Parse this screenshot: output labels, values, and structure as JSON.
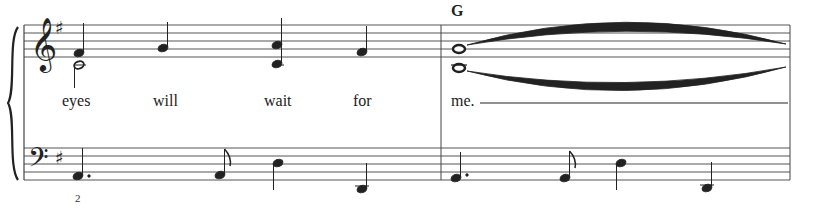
{
  "score": {
    "key_signature": "G major (1 sharp)",
    "clefs": {
      "treble": "treble-clef",
      "bass": "bass-clef"
    },
    "chord_symbols": [
      {
        "label": "G",
        "measure": 2
      }
    ],
    "lyrics": [
      {
        "text": "eyes",
        "x": 62
      },
      {
        "text": "will",
        "x": 153
      },
      {
        "text": "wait",
        "x": 264
      },
      {
        "text": "for",
        "x": 353
      },
      {
        "text": "me.",
        "x": 451
      }
    ],
    "fingering": [
      {
        "text": "2",
        "x": 75
      }
    ],
    "measures": [
      {
        "number": 1,
        "treble": [
          "F#4 quarter + C4 half",
          "G4 quarter",
          "C5+C4 quarter",
          "F#4 quarter"
        ],
        "bass": [
          "A2 dotted quarter",
          "A2 eighth",
          "D3 quarter",
          "D2 quarter"
        ]
      },
      {
        "number": 2,
        "treble": [
          "G4 whole",
          "B3 whole (tied)"
        ],
        "bass": [
          "G2 dotted quarter",
          "G2 eighth",
          "D3 quarter",
          "D2 quarter"
        ]
      }
    ],
    "colors": {
      "ink": "#222222",
      "staff": "#555555",
      "paper": "#ffffff"
    }
  }
}
